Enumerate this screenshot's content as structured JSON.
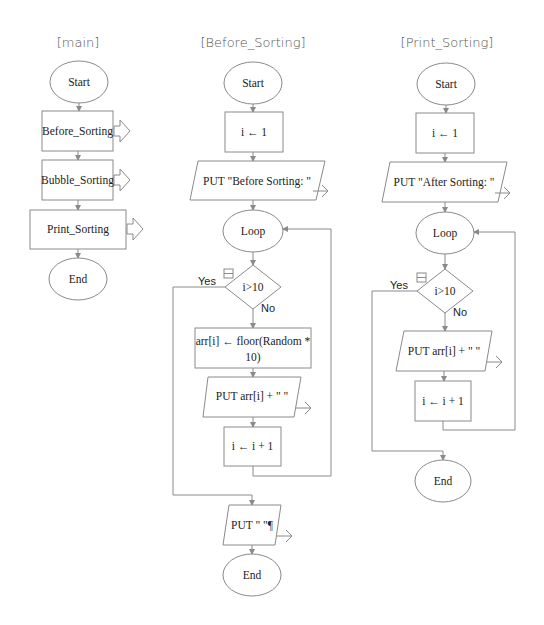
{
  "diagram": {
    "type": "flowchart",
    "columns": [
      {
        "title": "[main]",
        "nodes": [
          {
            "id": "start",
            "shape": "terminal",
            "label": "Start"
          },
          {
            "id": "call1",
            "shape": "call",
            "label": "Before_Sorting"
          },
          {
            "id": "call2",
            "shape": "call",
            "label": "Bubble_Sorting"
          },
          {
            "id": "call3",
            "shape": "call",
            "label": "Print_Sorting"
          },
          {
            "id": "end",
            "shape": "terminal",
            "label": "End"
          }
        ]
      },
      {
        "title": "[Before_Sorting]",
        "nodes": [
          {
            "id": "start",
            "shape": "terminal",
            "label": "Start"
          },
          {
            "id": "init",
            "shape": "process",
            "label": "i ← 1"
          },
          {
            "id": "out1",
            "shape": "output",
            "label": "PUT \"Before Sorting: \""
          },
          {
            "id": "loop",
            "shape": "terminal",
            "label": "Loop"
          },
          {
            "id": "cond",
            "shape": "decision",
            "label": "i>10",
            "yes": "Yes",
            "no": "No"
          },
          {
            "id": "assign",
            "shape": "process",
            "label_line1": "arr[i] ← floor(Random *",
            "label_line2": "10)"
          },
          {
            "id": "out2",
            "shape": "output",
            "label": "PUT arr[i] + \"  \""
          },
          {
            "id": "inc",
            "shape": "process",
            "label": "i ← i + 1"
          },
          {
            "id": "out3",
            "shape": "output",
            "label": "PUT \" \"¶"
          },
          {
            "id": "end",
            "shape": "terminal",
            "label": "End"
          }
        ]
      },
      {
        "title": "[Print_Sorting]",
        "nodes": [
          {
            "id": "start",
            "shape": "terminal",
            "label": "Start"
          },
          {
            "id": "init",
            "shape": "process",
            "label": "i ← 1"
          },
          {
            "id": "out1",
            "shape": "output",
            "label": "PUT \"After Sorting: \""
          },
          {
            "id": "loop",
            "shape": "terminal",
            "label": "Loop"
          },
          {
            "id": "cond",
            "shape": "decision",
            "label": "i>10",
            "yes": "Yes",
            "no": "No"
          },
          {
            "id": "out2",
            "shape": "output",
            "label": "PUT arr[i] + \"  \""
          },
          {
            "id": "inc",
            "shape": "process",
            "label": "i ← i + 1"
          },
          {
            "id": "end",
            "shape": "terminal",
            "label": "End"
          }
        ]
      }
    ],
    "colors": {
      "stroke": "#8a8a8a",
      "text": "#222222",
      "title": "#555555",
      "background": "#ffffff"
    }
  }
}
